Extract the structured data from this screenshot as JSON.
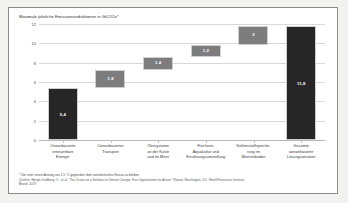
{
  "chart_data": {
    "type": "bar",
    "title": "Maximale jährliche Emissionsreduktionen in GtCO2e*",
    "xlabel": "",
    "ylabel": "",
    "ylim": [
      0,
      12
    ],
    "yticks": [
      "12",
      "10",
      "8",
      "6",
      "4",
      "2",
      "0"
    ],
    "grid": true,
    "legend": "none",
    "categories": [
      "Ozeanbasierte erneuerbare Energie",
      "Ozeanbasierter Transport",
      "Ökosysteme an der Küste und im Meer",
      "Fischerei, Aquakultur und Ernährungsumstellung",
      "Kohlenstoffspeicherung im Meeresboden",
      "Gesamte ozeanbasierte Lösungsansätze"
    ],
    "category_lines": [
      [
        "Ozeanbasierte",
        "erneuerbare",
        "Energie"
      ],
      [
        "Ozeanbasierter",
        "Transport"
      ],
      [
        "Ökosysteme",
        "an der Küste",
        "und im Meer"
      ],
      [
        "Fischerei,",
        "Aquakultur und",
        "Ernährungsumstellung"
      ],
      [
        "Kohlenstoffspeiche-",
        "rung im",
        "Meeresboden"
      ],
      [
        "Gesamte",
        "ozeanbasierte",
        "Lösungsansätze"
      ]
    ],
    "values": [
      5.4,
      1.8,
      1.4,
      1.2,
      2.0,
      11.8
    ],
    "value_labels": [
      "5,4",
      "1,8",
      "1,4",
      "1,2",
      "2",
      "11,8"
    ],
    "bar_bases": [
      0,
      5.4,
      7.2,
      8.6,
      9.8,
      0
    ],
    "bar_kinds": [
      "anchored",
      "floating",
      "floating",
      "floating",
      "floating",
      "anchored"
    ],
    "colors": {
      "anchored_bar": "#262626",
      "floating_bar": "#7d7d7d",
      "gridline": "#d8d8d8",
      "value_text": "#ffffff",
      "page_background": "#f2f2f0",
      "panel_background": "#ffffff"
    }
  },
  "footnotes": {
    "star": "* Um unter einem Anstieg von 1,5 °C gegenüber dem vorindustriellen Niveau zu bleiben",
    "source_line1": "Quellen: Hoegh-Guldberg, O., et al. \"The Ocean as a Solution to Climate Change: Five Opportunities for Action.\" Report, Washington, DC: World Resources Institute.",
    "source_line2": "Brand: 2019"
  }
}
